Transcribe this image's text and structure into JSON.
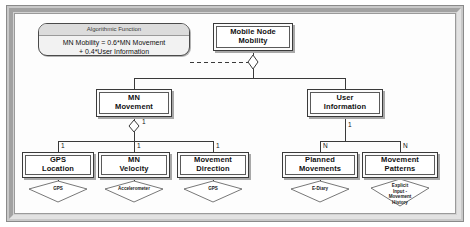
{
  "diagram": {
    "note": {
      "title": "Algorithmic Function",
      "body": "MN Mobility = 0.6*MN Movement\n+ 0.4*User Information"
    },
    "root": {
      "label": "Mobile Node\nMobility"
    },
    "level2": [
      {
        "label": "MN\nMovement",
        "multiplicity": "1"
      },
      {
        "label": "User\nInformation",
        "multiplicity": "1"
      }
    ],
    "level3": [
      {
        "label": "GPS\nLocation",
        "multiplicity": "1",
        "sensor": "GPS"
      },
      {
        "label": "MN\nVelocity",
        "multiplicity": "1",
        "sensor": "Accelerometer"
      },
      {
        "label": "Movement\nDirection",
        "multiplicity": "1",
        "sensor": "GPS"
      },
      {
        "label": "Planned\nMovements",
        "multiplicity": "N",
        "sensor": "E-Diary"
      },
      {
        "label": "Movement\nPatterns",
        "multiplicity": "N",
        "sensor": "Explicit\nInput -\nMovement\nHistory"
      }
    ],
    "colors": {
      "frame": "#c9c9c9",
      "box_border": "#3a3a3a",
      "note_fill": "#f2f2f2",
      "line": "#3a3a3a"
    }
  }
}
